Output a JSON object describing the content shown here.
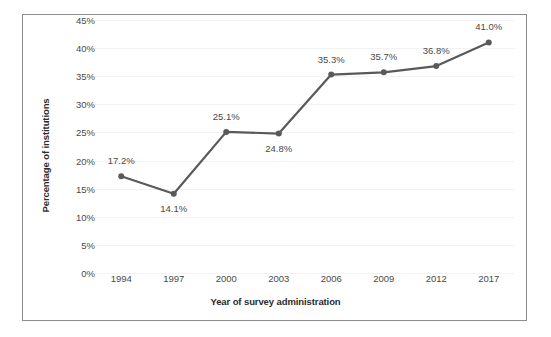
{
  "chart_data": {
    "type": "line",
    "title": "",
    "xlabel": "Year of survey administration",
    "ylabel": "Percentage of institutions",
    "categories": [
      "1994",
      "1997",
      "2000",
      "2003",
      "2006",
      "2009",
      "2012",
      "2017"
    ],
    "values": [
      17.2,
      14.1,
      25.1,
      24.8,
      35.3,
      35.7,
      36.8,
      41.0
    ],
    "data_labels": [
      "17.2%",
      "14.1%",
      "25.1%",
      "24.8%",
      "35.3%",
      "35.7%",
      "36.8%",
      "41.0%"
    ],
    "label_positions": [
      "above",
      "below",
      "above",
      "below",
      "above",
      "above",
      "above",
      "above"
    ],
    "ylim": [
      0,
      45
    ],
    "ytick_values": [
      45,
      40,
      35,
      30,
      25,
      20,
      15,
      10,
      5,
      0
    ],
    "ytick_labels": [
      "45%",
      "40%",
      "35%",
      "30%",
      "25%",
      "20%",
      "15%",
      "10%",
      "5%",
      "0%"
    ],
    "grid": true,
    "legend": "none",
    "series_color": "#595959",
    "marker": "circle",
    "marker_color": "#595959",
    "gridline_color": "#f2f2f2",
    "frame_color": "#8c8c8c",
    "background": "#ffffff",
    "text_color": "#4a4a4a",
    "axis_title_color": "#2b2b2b"
  }
}
